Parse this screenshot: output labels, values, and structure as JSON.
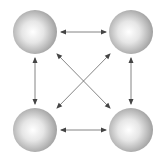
{
  "diagram": {
    "type": "fully-connected network",
    "nodes": [
      {
        "id": "node-top-left",
        "cx": 35,
        "cy": 32,
        "r": 22
      },
      {
        "id": "node-top-right",
        "cx": 131,
        "cy": 32,
        "r": 22
      },
      {
        "id": "node-bottom-left",
        "cx": 35,
        "cy": 130,
        "r": 22
      },
      {
        "id": "node-bottom-right",
        "cx": 131,
        "cy": 130,
        "r": 22
      }
    ],
    "edges": [
      {
        "from": "node-top-left",
        "to": "node-top-right",
        "bidirectional": true
      },
      {
        "from": "node-bottom-left",
        "to": "node-bottom-right",
        "bidirectional": true
      },
      {
        "from": "node-top-left",
        "to": "node-bottom-left",
        "bidirectional": true
      },
      {
        "from": "node-top-right",
        "to": "node-bottom-right",
        "bidirectional": true
      },
      {
        "from": "node-top-left",
        "to": "node-bottom-right",
        "bidirectional": true
      },
      {
        "from": "node-top-right",
        "to": "node-bottom-left",
        "bidirectional": true
      }
    ],
    "colors": {
      "edge": "#555555",
      "sphere_highlight": "#ffffff",
      "sphere_shadow": "#9a9a9a"
    }
  }
}
